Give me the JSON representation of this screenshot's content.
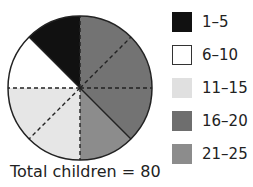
{
  "chart_data": {
    "type": "pie",
    "title": "",
    "footer": "Total children = 80",
    "total": 80,
    "start_angle_deg": 0,
    "direction": "clockwise",
    "division_lines": 8,
    "slices": [
      {
        "label": "16–20",
        "value": 30,
        "color": "#737373"
      },
      {
        "label": "21–25",
        "value": 10,
        "color": "#8c8c8c"
      },
      {
        "label": "11–15",
        "value": 20,
        "color": "#e6e6e6"
      },
      {
        "label": "6–10",
        "value": 10,
        "color": "#ffffff"
      },
      {
        "label": "1–5",
        "value": 10,
        "color": "#111111"
      }
    ],
    "legend": [
      {
        "label": "1–5",
        "color": "#111111"
      },
      {
        "label": "6–10",
        "color": "#ffffff"
      },
      {
        "label": "11–15",
        "color": "#e0e0e0"
      },
      {
        "label": "16–20",
        "color": "#6e6e6e"
      },
      {
        "label": "21–25",
        "color": "#8c8c8c"
      }
    ],
    "legend_position": "right"
  }
}
